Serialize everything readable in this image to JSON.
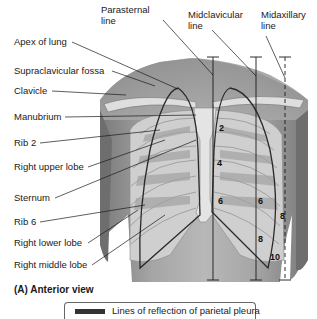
{
  "figure": {
    "top_labels": {
      "parasternal": [
        "Parasternal",
        "line"
      ],
      "midclavicular": [
        "Midclavicular",
        "line"
      ],
      "midaxillary": [
        "Midaxillary",
        "line"
      ]
    },
    "left_labels": [
      {
        "id": "apex-of-lung",
        "text": "Apex of lung"
      },
      {
        "id": "supraclavicular-fossa",
        "text": "Supraclavicular fossa"
      },
      {
        "id": "clavicle",
        "text": "Clavicle"
      },
      {
        "id": "manubrium",
        "text": "Manubrium"
      },
      {
        "id": "rib-2",
        "text": "Rib 2"
      },
      {
        "id": "right-upper-lobe",
        "text": "Right upper lobe"
      },
      {
        "id": "sternum",
        "text": "Sternum"
      },
      {
        "id": "rib-6",
        "text": "Rib 6"
      },
      {
        "id": "right-lower-lobe",
        "text": "Right lower lobe"
      },
      {
        "id": "right-middle-lobe",
        "text": "Right middle lobe"
      }
    ],
    "rib_numbers": {
      "parasternal": [
        "2",
        "4",
        "6"
      ],
      "midclavicular": [
        "6",
        "8"
      ],
      "midaxillary": [
        "8",
        "10"
      ]
    },
    "caption": "(A) Anterior view",
    "legend": {
      "text": "Lines of reflection of parietal pleura",
      "swatch_color": "#333333"
    }
  },
  "colors": {
    "skin": "#9a9a9a",
    "skin_light": "#c8c8c8",
    "bone": "#dcdcdc",
    "lung_dark": "#8a8a8a",
    "pleura_line": "#2a2a2a"
  }
}
